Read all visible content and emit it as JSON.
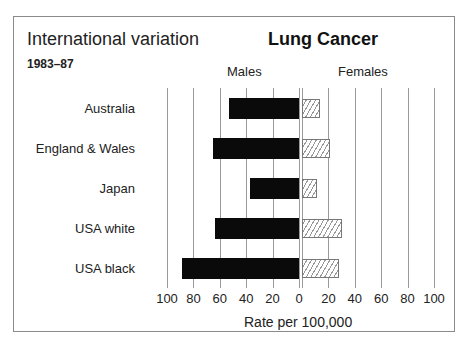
{
  "title": "International variation",
  "subtitle": "1983–87",
  "chart_title": "Lung Cancer",
  "headers": {
    "males": "Males",
    "females": "Females"
  },
  "xlabel": "Rate per 100,000",
  "ticks_left": [
    "100",
    "80",
    "60",
    "40",
    "20",
    "0"
  ],
  "ticks_right": [
    "20",
    "40",
    "60",
    "80",
    "100"
  ],
  "chart_data": {
    "type": "bar",
    "orientation": "horizontal-butterfly",
    "title": "Lung Cancer",
    "subtitle": "International variation 1983–87",
    "categories": [
      "Australia",
      "England & Wales",
      "Japan",
      "USA white",
      "USA black"
    ],
    "series": [
      {
        "name": "Males",
        "values": [
          53,
          65,
          37,
          64,
          89
        ],
        "style": "solid black",
        "direction": "left"
      },
      {
        "name": "Females",
        "values": [
          14,
          21,
          11,
          30,
          28
        ],
        "style": "hatched",
        "direction": "right"
      }
    ],
    "xlabel": "Rate per 100,000",
    "ylabel": "",
    "xlim": [
      0,
      100
    ],
    "xticks": [
      0,
      20,
      40,
      60,
      80,
      100
    ],
    "grid": true,
    "legend": "column headers (Males / Females)"
  }
}
